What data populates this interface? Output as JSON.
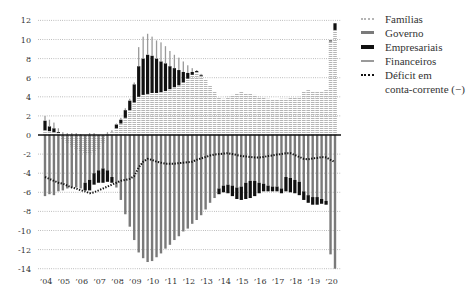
{
  "legend": {
    "familias": "Famílias",
    "governo": "Governo",
    "empresariais": "Empresariais",
    "financeiros": "Financeiros",
    "deficit_line1": "Déficit em",
    "deficit_line2": "conta-corrente (−)"
  },
  "colors": {
    "familias": "#b5b5b5",
    "governo": "#7a7a7a",
    "empresariais": "#111111",
    "financeiros": "#9a9a9a",
    "deficit": "#111111",
    "zero_line": "#111111",
    "grid": "#9a9a9a"
  },
  "chart_data": {
    "type": "bar",
    "stacked": true,
    "title": "",
    "xlabel": "",
    "ylabel": "",
    "ylim": [
      -14,
      12
    ],
    "grid": true,
    "legend_position": "right",
    "yticks": [
      12,
      10,
      8,
      6,
      4,
      2,
      0,
      -2,
      -4,
      -6,
      -8,
      -10,
      -12,
      -14
    ],
    "ytick_labels": [
      "12",
      "10",
      "8",
      "6",
      "4",
      "2",
      "0",
      "-2",
      "-4",
      "-6",
      "-8",
      "-10",
      "-12",
      "-14"
    ],
    "xtick_labels": [
      "’04",
      "’05",
      "’06",
      "’07",
      "’08",
      "’09",
      "’10",
      "’11",
      "’12",
      "’13",
      "’14",
      "’15",
      "’16",
      "’17",
      "’18",
      "’19",
      "’20"
    ],
    "categories": [
      "2004Q1",
      "2004Q2",
      "2004Q3",
      "2004Q4",
      "2005Q1",
      "2005Q2",
      "2005Q3",
      "2005Q4",
      "2006Q1",
      "2006Q2",
      "2006Q3",
      "2006Q4",
      "2007Q1",
      "2007Q2",
      "2007Q3",
      "2007Q4",
      "2008Q1",
      "2008Q2",
      "2008Q3",
      "2008Q4",
      "2009Q1",
      "2009Q2",
      "2009Q3",
      "2009Q4",
      "2010Q1",
      "2010Q2",
      "2010Q3",
      "2010Q4",
      "2011Q1",
      "2011Q2",
      "2011Q3",
      "2011Q4",
      "2012Q1",
      "2012Q2",
      "2012Q3",
      "2012Q4",
      "2013Q1",
      "2013Q2",
      "2013Q3",
      "2013Q4",
      "2014Q1",
      "2014Q2",
      "2014Q3",
      "2014Q4",
      "2015Q1",
      "2015Q2",
      "2015Q3",
      "2015Q4",
      "2016Q1",
      "2016Q2",
      "2016Q3",
      "2016Q4",
      "2017Q1",
      "2017Q2",
      "2017Q3",
      "2017Q4",
      "2018Q1",
      "2018Q2",
      "2018Q3",
      "2018Q4",
      "2019Q1",
      "2019Q2",
      "2019Q3",
      "2019Q4",
      "2020Q1",
      "2020Q2"
    ],
    "series": [
      {
        "name": "Famílias",
        "key": "familias",
        "values": [
          0.5,
          0.4,
          0.3,
          0.2,
          -0.5,
          -0.8,
          -1.2,
          -1.5,
          -1.8,
          -2.0,
          -2.0,
          -1.8,
          -1.5,
          -0.8,
          0.1,
          0.3,
          0.7,
          1.2,
          1.8,
          2.6,
          3.4,
          4.0,
          4.2,
          4.3,
          4.4,
          4.4,
          4.5,
          4.6,
          4.8,
          5.0,
          5.2,
          5.5,
          5.9,
          6.3,
          6.6,
          6.2,
          5.8,
          5.2,
          4.5,
          3.9,
          3.8,
          4.0,
          4.2,
          4.4,
          4.5,
          4.4,
          4.3,
          4.2,
          4.0,
          3.9,
          3.8,
          3.7,
          3.7,
          3.8,
          3.8,
          3.9,
          3.9,
          4.0,
          4.6,
          4.7,
          4.6,
          4.5,
          4.6,
          4.7,
          9.8,
          11.0
        ]
      },
      {
        "name": "Governo",
        "key": "governo",
        "values": [
          -6.4,
          -6.2,
          -6.3,
          -5.9,
          -5.8,
          -5.6,
          -5.5,
          -5.5,
          -5.6,
          -5.0,
          -4.7,
          -4.0,
          -3.7,
          -3.5,
          -3.7,
          -4.4,
          -5.5,
          -6.8,
          -8.3,
          -9.6,
          -11.0,
          -12.3,
          -12.9,
          -13.3,
          -13.2,
          -12.8,
          -12.4,
          -11.9,
          -11.5,
          -11.0,
          -10.6,
          -10.1,
          -9.8,
          -9.3,
          -8.9,
          -8.4,
          -7.8,
          -7.1,
          -6.6,
          -5.6,
          -5.3,
          -5.2,
          -5.3,
          -5.5,
          -5.4,
          -5.0,
          -4.8,
          -4.8,
          -5.0,
          -5.1,
          -5.3,
          -5.4,
          -5.4,
          -5.6,
          -4.4,
          -4.5,
          -4.7,
          -4.9,
          -5.9,
          -6.3,
          -6.5,
          -6.5,
          -6.7,
          -6.9,
          -12.5,
          -14.0
        ]
      },
      {
        "name": "Empresariais",
        "key": "empresariais",
        "values": [
          1.0,
          0.5,
          0.4,
          0.1,
          0,
          0,
          0,
          0,
          0,
          -0.8,
          -1.1,
          -1.2,
          -1.3,
          -1.5,
          -1.2,
          -0.6,
          0.4,
          0.4,
          0.8,
          1.0,
          1.9,
          3.2,
          3.8,
          4.1,
          3.9,
          3.6,
          3.2,
          2.9,
          2.4,
          2.0,
          1.6,
          1.1,
          0.6,
          0.3,
          0.1,
          0.1,
          0,
          0,
          0,
          -0.6,
          -0.7,
          -0.9,
          -1.1,
          -1.2,
          -1.4,
          -1.7,
          -1.8,
          -1.6,
          -1.1,
          -0.8,
          -0.6,
          -0.5,
          -0.5,
          -0.5,
          -1.5,
          -1.5,
          -1.4,
          -1.4,
          -0.9,
          -0.8,
          -0.8,
          -0.8,
          -0.5,
          -0.4,
          0.1,
          0.7
        ]
      },
      {
        "name": "Financeiros",
        "key": "financeiros",
        "values": [
          0.5,
          0.7,
          0.6,
          0.4,
          0.3,
          0.2,
          0.2,
          0.2,
          0.1,
          0,
          0.2,
          0.2,
          0,
          0,
          0.2,
          0.2,
          0.1,
          0.2,
          0.2,
          0.2,
          0.2,
          2.0,
          2.3,
          2.2,
          2.0,
          1.9,
          2.0,
          1.8,
          1.6,
          1.4,
          1.3,
          1.1,
          0.8,
          0.4,
          0.1,
          0.1,
          0,
          0,
          0,
          0,
          0,
          0,
          0,
          0,
          0,
          0,
          0,
          0,
          0,
          0,
          0,
          0,
          0,
          0,
          0,
          0,
          0,
          0,
          0,
          0,
          0,
          0,
          0,
          0,
          0,
          0
        ]
      },
      {
        "name": "Déficit em conta-corrente (−)",
        "key": "deficit",
        "type": "line",
        "values": [
          -4.4,
          -4.6,
          -4.8,
          -5.0,
          -5.1,
          -5.3,
          -5.5,
          -5.6,
          -5.8,
          -5.9,
          -6.1,
          -6.0,
          -5.8,
          -5.6,
          -5.4,
          -5.2,
          -5.0,
          -4.8,
          -4.7,
          -4.6,
          -4.3,
          -3.4,
          -2.8,
          -2.5,
          -2.6,
          -2.8,
          -2.9,
          -3.0,
          -3.0,
          -3.0,
          -2.95,
          -2.9,
          -2.85,
          -2.8,
          -2.6,
          -2.45,
          -2.3,
          -2.15,
          -2.05,
          -2.0,
          -1.95,
          -1.9,
          -2.0,
          -2.1,
          -2.2,
          -2.25,
          -2.3,
          -2.35,
          -2.35,
          -2.3,
          -2.2,
          -2.15,
          -2.05,
          -2.0,
          -1.9,
          -1.9,
          -2.1,
          -2.3,
          -2.5,
          -2.55,
          -2.45,
          -2.4,
          -2.3,
          -2.35,
          -2.6,
          -2.85
        ]
      }
    ]
  }
}
